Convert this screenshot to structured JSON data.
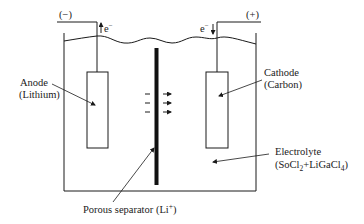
{
  "diagram": {
    "type": "electrochemical-cell",
    "terminals": {
      "negative": {
        "label": "(−)",
        "electron_label": "e",
        "electron_superscript": "−",
        "electron_direction": "up"
      },
      "positive": {
        "label": "(+)",
        "electron_label": "e",
        "electron_superscript": "−",
        "electron_direction": "down"
      }
    },
    "anode": {
      "line1": "Anode",
      "line2": "(Lithium)"
    },
    "cathode": {
      "line1": "Cathode",
      "line2": "(Carbon)"
    },
    "electrolyte": {
      "line1": "Electrolyte",
      "formula_parts": [
        "(SoCl",
        "2",
        "+LiGaCl",
        "4",
        ")"
      ]
    },
    "separator": {
      "label_main": "Porous separator (Li",
      "label_sup": "+",
      "label_end": ")"
    },
    "ion_flow": {
      "count": 3,
      "direction": "right"
    },
    "colors": {
      "line": "#1a1a1a",
      "background": "#ffffff"
    }
  }
}
